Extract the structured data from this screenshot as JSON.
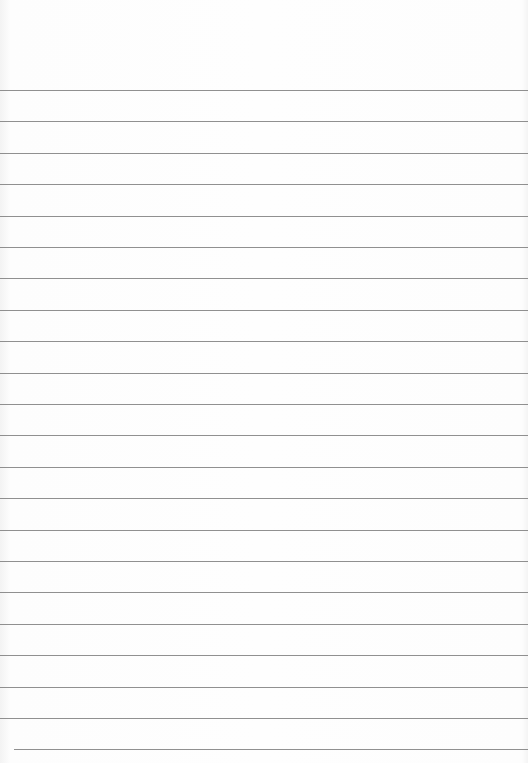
{
  "page": {
    "type": "blank lined paper",
    "background_color": "#fdfdfd",
    "rule_color": "#7c7c7c",
    "rule_count": 22,
    "first_rule_y": 90,
    "rule_spacing": 31.4
  }
}
